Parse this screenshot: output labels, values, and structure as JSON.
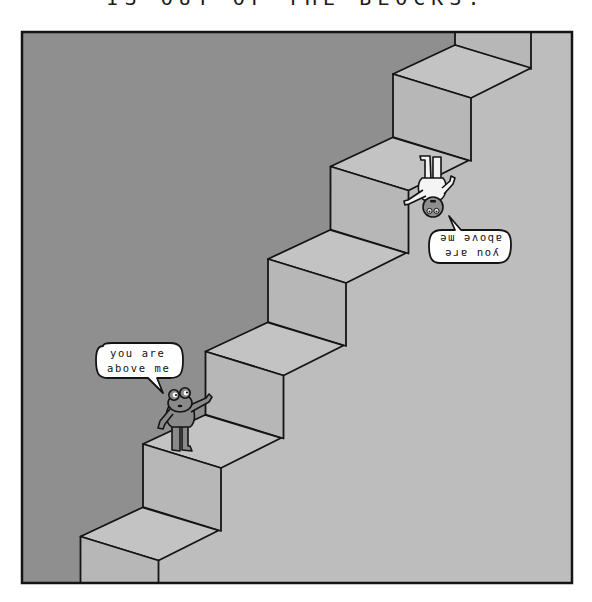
{
  "comic": {
    "top_caption": "IS OUT OF THE BLOCKS.",
    "panel": {
      "steps_count": 6,
      "colors": {
        "wall": "#8f8f8f",
        "stairs": "#bdbdbd",
        "tread": "#c3c3c3",
        "riser": "#b7b7b7",
        "ink": "#141414",
        "frog_body": "#8a8a8a",
        "upside_down_character": "#f4f4f4",
        "bubble": "#ffffff"
      }
    },
    "characters": [
      {
        "name": "frog",
        "orientation": "upright",
        "pose": "pointing up the stairs",
        "speech": {
          "line1": "you are",
          "line2": "above me"
        }
      },
      {
        "name": "pale figure",
        "orientation": "upside-down",
        "pose": "pointing down the stairs",
        "speech": {
          "line1": "you are",
          "line2": "above me"
        }
      }
    ]
  }
}
